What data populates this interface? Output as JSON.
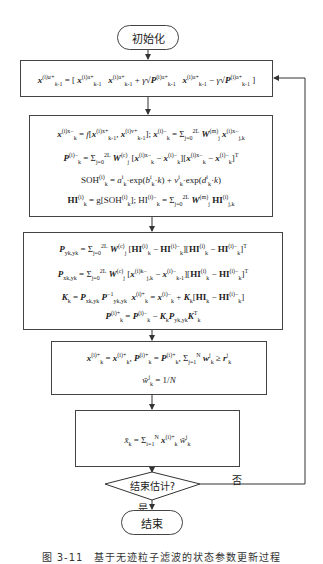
{
  "flowchart": {
    "start": {
      "label": "初始化"
    },
    "box1": {
      "lines": [
        "x(i)a+ k-1 = [ x(i)a+ k-1   x(i)a+ k-1 + γ√P(i)a+ k-1   x(i)a+ k-1 − γ√P(i)a+ k-1 ]"
      ]
    },
    "box2": {
      "lines": [
        "x(i)x− k = f[x(i)x+ k-1 , x(i)v+ k-1]; x(i)− k = Σ(j=0..2L) W(m) j x(i)x− j,k",
        "P(i)− k = Σ(j=0..2L) W(c) j [x(i)x− k − x(i)− k][x(i)x− k − x(i)− k]T",
        "SOH(i) k = a(i) k · exp(b(i) k · k) + v(i) k · exp(d(i) k · k)",
        "HI(i) k = g[SOH(i) k]; HI(i)− k = Σ(j=0..2L) W(m) j HI(i) j,k"
      ]
    },
    "box3": {
      "lines": [
        "P yk,yk = Σ(j=0..2L) W(c) j [HI(i) k − HI(i)− k][HI(i) k − HI(i)− k]T",
        "P xk,yk = Σ(j=0..2L) W(c) j [x(i)x− j,k − x(i)− k-1][HI(i) k − HI(i)− k]T",
        "K k = P xk,yk P−1 yk,yk   x(i)+ k = x(i)− k + K k [HI k − HI(i)− k]",
        "P(i)+ k = P(i)− k − K k P yk,yk K T k"
      ]
    },
    "box4": {
      "lines": [
        "x(i)+ k = x(i)+ k , P(i)+ k = P(i)+ k , Σ(j=1..N) w j k ≥ r j k",
        "w̄ j k = 1/N"
      ]
    },
    "box5": {
      "lines": [
        "x̄ k = Σ(i=1..N) x(i)+ k w̄ j k"
      ]
    },
    "decision": {
      "label": "结束估计?"
    },
    "yes_label": "是",
    "no_label": "否",
    "end": {
      "label": "结束"
    }
  },
  "caption": "图 3-11　基于无迹粒子滤波的状态参数更新过程"
}
